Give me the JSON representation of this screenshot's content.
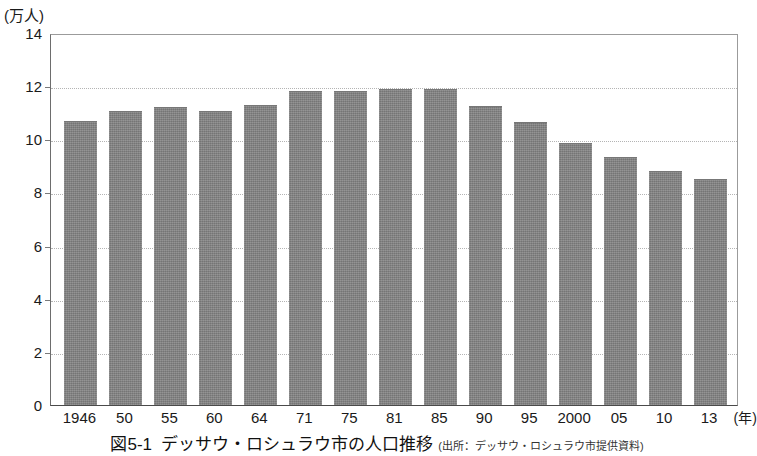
{
  "figure": {
    "y_unit_label": "(万人)",
    "x_unit_label": "(年)",
    "caption_number": "図5-1",
    "caption_title": "デッサウ・ロシュラウ市の人口推移",
    "caption_source": "(出所：デッサウ・ロシュラウ市提供資料)",
    "bar_color": "#808080",
    "grid_color": "#b4b4b4",
    "axis_color": "#4a4a4a"
  },
  "chart_data": {
    "type": "bar",
    "title": "デッサウ・ロシュラウ市の人口推移",
    "xlabel": "(年)",
    "ylabel": "(万人)",
    "ylim": [
      0,
      14
    ],
    "ytick_step": 2,
    "yticks": [
      "0",
      "2",
      "4",
      "6",
      "8",
      "10",
      "12",
      "14"
    ],
    "grid": true,
    "legend": false,
    "categories": [
      "1946",
      "50",
      "55",
      "60",
      "64",
      "71",
      "75",
      "81",
      "85",
      "90",
      "95",
      "2000",
      "05",
      "10",
      "13"
    ],
    "values": [
      10.7,
      11.05,
      11.2,
      11.05,
      11.3,
      11.8,
      11.8,
      11.9,
      11.9,
      11.25,
      10.65,
      9.85,
      9.35,
      8.8,
      8.5
    ]
  }
}
